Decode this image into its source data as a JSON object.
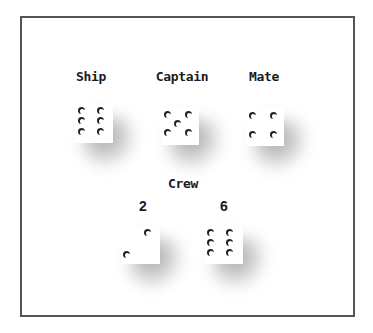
{
  "colors": {
    "frame": "#555555",
    "text": "#1a1a1a",
    "pip": "#222222",
    "die_face": "#ffffff"
  },
  "labels": {
    "ship": "Ship",
    "captain": "Captain",
    "mate": "Mate",
    "crew": "Crew"
  },
  "dice": {
    "ship": {
      "value": 6
    },
    "captain": {
      "value": 5
    },
    "mate": {
      "value": 4
    },
    "crew": [
      {
        "label": "2",
        "value": 2
      },
      {
        "label": "6",
        "value": 6
      }
    ]
  }
}
